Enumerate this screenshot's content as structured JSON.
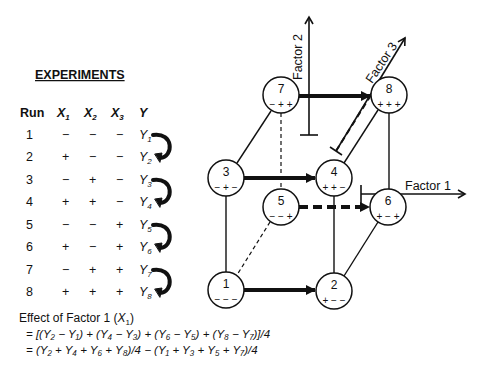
{
  "experiments": {
    "title": "EXPERIMENTS",
    "headers": {
      "run": "Run",
      "x1": "X",
      "x1_sub": "1",
      "x2": "X",
      "x2_sub": "2",
      "x3": "X",
      "x3_sub": "3",
      "y": "Y"
    },
    "rows": [
      {
        "run": "1",
        "x1": "−",
        "x2": "−",
        "x3": "−",
        "y": "Y",
        "y_sub": "1"
      },
      {
        "run": "2",
        "x1": "+",
        "x2": "−",
        "x3": "−",
        "y": "Y",
        "y_sub": "2"
      },
      {
        "run": "3",
        "x1": "−",
        "x2": "+",
        "x3": "−",
        "y": "Y",
        "y_sub": "3"
      },
      {
        "run": "4",
        "x1": "+",
        "x2": "+",
        "x3": "−",
        "y": "Y",
        "y_sub": "4"
      },
      {
        "run": "5",
        "x1": "−",
        "x2": "−",
        "x3": "+",
        "y": "Y",
        "y_sub": "5"
      },
      {
        "run": "6",
        "x1": "+",
        "x2": "−",
        "x3": "+",
        "y": "Y",
        "y_sub": "6"
      },
      {
        "run": "7",
        "x1": "−",
        "x2": "+",
        "x3": "+",
        "y": "Y",
        "y_sub": "7"
      },
      {
        "run": "8",
        "x1": "+",
        "x2": "+",
        "x3": "+",
        "y": "Y",
        "y_sub": "8"
      }
    ]
  },
  "effect": {
    "title": "Effect of Factor 1 (",
    "title_var": "X",
    "title_sub": "1",
    "title_end": ")",
    "line1": "=  [(Y₂ − Y₁) + (Y₄ − Y₃) + (Y₆ − Y₅) + (Y₈ − Y₇)]/4",
    "line2": "=  (Y₂ + Y₄ + Y₆ + Y₈)/4  −  (Y₁ + Y₃ + Y₅ + Y₇)/4"
  },
  "cube": {
    "nodes": [
      {
        "id": "1",
        "signs": "− − −"
      },
      {
        "id": "2",
        "signs": "+ − −"
      },
      {
        "id": "3",
        "signs": "− + −"
      },
      {
        "id": "4",
        "signs": "+ + −"
      },
      {
        "id": "5",
        "signs": "− − +"
      },
      {
        "id": "6",
        "signs": "+ − +"
      },
      {
        "id": "7",
        "signs": "− + +"
      },
      {
        "id": "8",
        "signs": "+ + +"
      }
    ],
    "axes": {
      "factor1": "Factor  1",
      "factor2": "Factor  2",
      "factor3": "Factor  3"
    }
  }
}
